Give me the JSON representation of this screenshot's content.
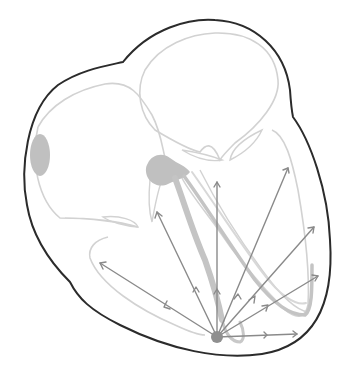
{
  "diagram": {
    "title": "",
    "colors": {
      "background": "#ffffff",
      "outline": "#2b2b2b",
      "chambers": "#cfcfcf",
      "nodes": "#bdbdbd",
      "bundles": "#c4c4c4",
      "vectors": "#8a8a8a",
      "origin": "#8f8f8f"
    },
    "origin": {
      "x": 217,
      "y": 337,
      "r": 6
    },
    "vectors": [
      {
        "id": "v-left",
        "x2": 100,
        "y2": 263,
        "mid": 0.45
      },
      {
        "id": "v-upper-left",
        "x2": 157,
        "y2": 212,
        "mid": 0.55
      },
      {
        "id": "v-vertical",
        "x2": 217,
        "y2": 182,
        "mid": 0.28
      },
      {
        "id": "v-upper-right",
        "x2": 288,
        "y2": 168,
        "mid": 0.2
      },
      {
        "id": "v-right-1",
        "x2": 314,
        "y2": 227,
        "mid": 0.28
      },
      {
        "id": "v-right-2",
        "x2": 318,
        "y2": 276,
        "mid": 0.35
      },
      {
        "id": "v-horizontal",
        "x2": 297,
        "y2": 334,
        "mid": 0.55
      }
    ],
    "labels": []
  }
}
